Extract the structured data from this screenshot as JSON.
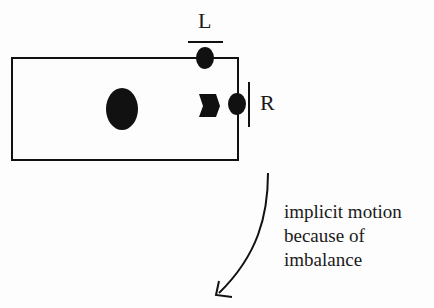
{
  "labels": {
    "left": "L",
    "right": "R"
  },
  "caption": {
    "lines": [
      "implicit motion",
      "because of",
      "imbalance"
    ]
  },
  "colors": {
    "ink": "#111111",
    "background": "#fdfdfd"
  }
}
